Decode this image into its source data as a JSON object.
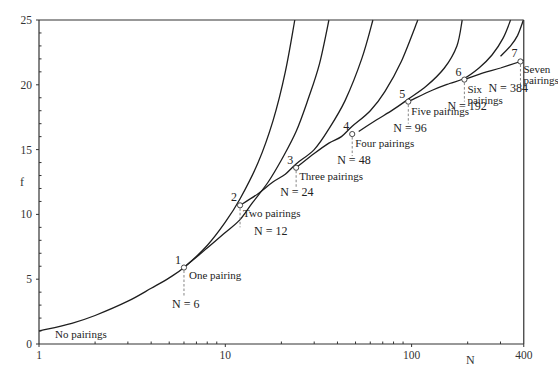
{
  "chart_data": {
    "type": "line",
    "title": "",
    "xlabel": "N",
    "ylabel": "f",
    "xscale": "log",
    "xlim": [
      1,
      400
    ],
    "ylim": [
      0,
      25
    ],
    "x_ticks": [
      {
        "value": 1,
        "label": "1"
      },
      {
        "value": 10,
        "label": "10"
      },
      {
        "value": 100,
        "label": "100"
      },
      {
        "value": 400,
        "label": "400"
      }
    ],
    "x_minor_ticks": [
      2,
      3,
      4,
      5,
      6,
      7,
      8,
      9,
      20,
      30,
      40,
      50,
      60,
      70,
      80,
      90,
      200,
      300
    ],
    "y_ticks": [
      {
        "value": 0,
        "label": "0"
      },
      {
        "value": 5,
        "label": "5"
      },
      {
        "value": 10,
        "label": "10"
      },
      {
        "value": 15,
        "label": "15"
      },
      {
        "value": 20,
        "label": "20"
      },
      {
        "value": 25,
        "label": "25"
      }
    ],
    "grid": false,
    "legend": "none",
    "series": [
      {
        "name": "No pairings",
        "points": [
          [
            1,
            1.0
          ],
          [
            1.5,
            1.6
          ],
          [
            2,
            2.2
          ],
          [
            3,
            3.3
          ],
          [
            4,
            4.3
          ],
          [
            5,
            5.1
          ],
          [
            6,
            5.9
          ],
          [
            8,
            7.6
          ],
          [
            10,
            9.4
          ],
          [
            12,
            11.2
          ],
          [
            15,
            14.0
          ],
          [
            18,
            17.2
          ],
          [
            21,
            21.0
          ],
          [
            23.6,
            25
          ]
        ]
      },
      {
        "name": "One pairing",
        "points": [
          [
            6,
            5.9
          ],
          [
            8,
            7.4
          ],
          [
            10,
            8.6
          ],
          [
            12,
            9.6
          ],
          [
            14,
            10.9
          ],
          [
            17,
            12.5
          ],
          [
            20,
            14.2
          ],
          [
            24,
            16.4
          ],
          [
            28,
            19.0
          ],
          [
            32,
            21.6
          ],
          [
            36,
            25
          ]
        ]
      },
      {
        "name": "Two pairings",
        "points": [
          [
            12,
            10.7
          ],
          [
            15,
            11.6
          ],
          [
            18,
            12.5
          ],
          [
            21,
            13.1
          ],
          [
            24,
            13.9
          ],
          [
            30,
            15.0
          ],
          [
            36,
            16.6
          ],
          [
            44,
            18.8
          ],
          [
            54,
            22.0
          ],
          [
            62,
            25
          ]
        ]
      },
      {
        "name": "Three pairings",
        "points": [
          [
            24,
            13.6
          ],
          [
            30,
            14.7
          ],
          [
            36,
            15.5
          ],
          [
            42,
            16.0
          ],
          [
            48,
            16.8
          ],
          [
            60,
            18.0
          ],
          [
            72,
            19.5
          ],
          [
            88,
            21.8
          ],
          [
            108,
            25
          ]
        ]
      },
      {
        "name": "Four pairings",
        "points": [
          [
            52,
            16.4
          ],
          [
            65,
            17.3
          ],
          [
            80,
            18.1
          ],
          [
            96,
            18.9
          ],
          [
            120,
            19.9
          ],
          [
            150,
            21.3
          ],
          [
            175,
            23.0
          ],
          [
            187,
            25
          ]
        ]
      },
      {
        "name": "Five pairings",
        "points": [
          [
            96,
            18.7
          ],
          [
            130,
            19.6
          ],
          [
            160,
            20.1
          ],
          [
            192,
            20.5
          ],
          [
            230,
            21.3
          ],
          [
            270,
            22.3
          ],
          [
            310,
            23.6
          ],
          [
            340,
            25
          ]
        ]
      },
      {
        "name": "Six pairings",
        "points": [
          [
            192,
            20.4
          ],
          [
            240,
            20.9
          ],
          [
            300,
            21.3
          ],
          [
            384,
            21.8
          ],
          [
            400,
            21.9
          ]
        ]
      },
      {
        "name": "Seven pairings curve",
        "points": [
          [
            300,
            22.2
          ],
          [
            340,
            23.0
          ],
          [
            370,
            23.8
          ],
          [
            398,
            25
          ]
        ]
      }
    ],
    "marked_points": [
      {
        "id": "1",
        "N": 6,
        "f": 5.9,
        "label": "One pairing",
        "n_label": "N = 6"
      },
      {
        "id": "2",
        "N": 12,
        "f": 10.7,
        "label": "Two pairings",
        "n_label": "N = 12"
      },
      {
        "id": "3",
        "N": 24,
        "f": 13.6,
        "label": "Three pairings",
        "n_label": "N = 24"
      },
      {
        "id": "4",
        "N": 48,
        "f": 16.2,
        "label": "Four pairings",
        "n_label": "N = 48"
      },
      {
        "id": "5",
        "N": 96,
        "f": 18.7,
        "label": "Five pairings",
        "n_label": "N = 96"
      },
      {
        "id": "6",
        "N": 192,
        "f": 20.4,
        "label": "Six pairings",
        "n_label": "N = 192"
      },
      {
        "id": "7",
        "N": 384,
        "f": 21.8,
        "label": "Seven pairings",
        "n_label": "N = 384"
      }
    ],
    "annotations": [
      {
        "text": "No pairings",
        "N": 1.22,
        "f": 0.45
      }
    ]
  },
  "layout": {
    "x0": 39,
    "px_per_decade": 186.3,
    "y0": 344,
    "px_per_unit": 12.96
  }
}
